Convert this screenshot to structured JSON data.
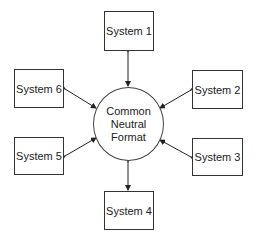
{
  "diagram": {
    "hub": {
      "lines": [
        "Common",
        "Neutral",
        "Format"
      ]
    },
    "systems": [
      {
        "label": "System 1",
        "position": "top"
      },
      {
        "label": "System 2",
        "position": "upper-right"
      },
      {
        "label": "System 3",
        "position": "lower-right"
      },
      {
        "label": "System 4",
        "position": "bottom"
      },
      {
        "label": "System 5",
        "position": "lower-left"
      },
      {
        "label": "System 6",
        "position": "upper-left"
      }
    ],
    "connections": "bidirectional arrows between hub and each system"
  }
}
